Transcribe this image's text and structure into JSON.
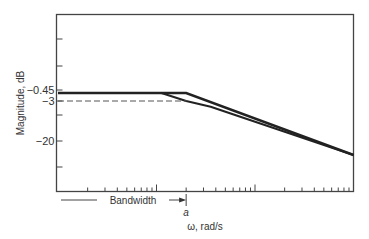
{
  "chart_data": {
    "type": "line",
    "title": "",
    "xlabel": "ω, rad/s",
    "ylabel": "Magnitude, dB",
    "x_scale": "log",
    "x_decades": 3,
    "x_minor_ticks_per_decade": [
      2,
      3,
      4,
      5,
      6,
      7,
      8,
      9
    ],
    "corner_label": "a",
    "corner_decade_position": 1.301,
    "y_ticks": [
      {
        "value": -0.45,
        "label": "−0.45"
      },
      {
        "value": -3,
        "label": "−3"
      },
      {
        "value": -20,
        "label": "−20"
      }
    ],
    "y_unlabeled_tick_count": 4,
    "series": [
      {
        "name": "asymptote",
        "style": "thick-solid",
        "points": [
          [
            0,
            -0.45
          ],
          [
            1.301,
            -0.45
          ],
          [
            3.0,
            -20
          ]
        ]
      },
      {
        "name": "actual-response",
        "style": "solid",
        "points": [
          [
            0,
            -0.45
          ],
          [
            1.05,
            -0.45
          ],
          [
            1.301,
            -3
          ],
          [
            1.55,
            -4.8
          ],
          [
            3.0,
            -20
          ]
        ]
      },
      {
        "name": "minus-3dB-reference",
        "style": "dashed",
        "points": [
          [
            0,
            -3
          ],
          [
            1.301,
            -3
          ]
        ]
      }
    ],
    "annotations": [
      {
        "text": "Bandwidth",
        "type": "arrow",
        "from_decade": 0,
        "to_decade": 1.301
      }
    ],
    "grid": false,
    "legend": "none"
  }
}
